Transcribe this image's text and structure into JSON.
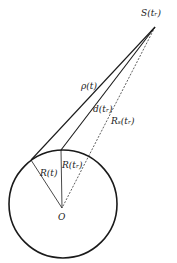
{
  "diagram": {
    "title": "",
    "colors": {
      "stroke": "#1a1a1a",
      "background": "#ffffff"
    },
    "labels": {
      "source": "S(tᵣ)",
      "rho": "ρ(t)",
      "d": "d(tᵣ)",
      "rs": "Rₛ(tᵣ)",
      "r_t": "R(t)",
      "r_tr": "R(tᵣ)",
      "origin": "O"
    },
    "geometry": {
      "circle": {
        "cx": 63,
        "cy": 204,
        "r": 54
      },
      "source_point": {
        "x": 155,
        "y": 27
      },
      "origin_point": {
        "x": 62,
        "y": 208
      },
      "tangent_point_t": {
        "x": 31,
        "y": 160
      },
      "point_tr": {
        "x": 61,
        "y": 150
      }
    }
  }
}
